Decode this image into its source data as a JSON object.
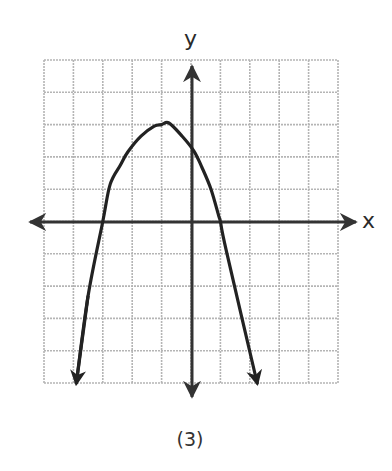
{
  "chart_data": {
    "type": "line",
    "title": "",
    "caption": "(3)",
    "xlabel": "x",
    "ylabel": "y",
    "xlim": [
      -5,
      5
    ],
    "ylim": [
      -5,
      5
    ],
    "grid": true,
    "grid_step": 1,
    "tick_labels": false,
    "series": [
      {
        "name": "parabola",
        "description": "Downward-opening parabola with arrows at both ends",
        "vertex": [
          -1,
          3
        ],
        "x_intercepts": [
          -3,
          1
        ],
        "y_intercept": 2.25,
        "equation_approx": "y = -0.75(x + 1)^2 + 3",
        "points": [
          [
            -3.9,
            -5
          ],
          [
            -3.5,
            -2.3
          ],
          [
            -3,
            0
          ],
          [
            -2.75,
            1.15
          ],
          [
            -2.4,
            1.75
          ],
          [
            -2.15,
            2.15
          ],
          [
            -1.7,
            2.64
          ],
          [
            -1.25,
            2.95
          ],
          [
            -1,
            3
          ],
          [
            -0.75,
            3.05
          ],
          [
            -0.3,
            2.64
          ],
          [
            0.1,
            2.18
          ],
          [
            0.37,
            1.68
          ],
          [
            0.68,
            1.0
          ],
          [
            0.95,
            0.15
          ],
          [
            1,
            0
          ],
          [
            1.2,
            -0.9
          ],
          [
            2.25,
            -5
          ]
        ],
        "end_arrows": true
      }
    ]
  },
  "labels": {
    "x_axis": "x",
    "y_axis": "y",
    "caption": "(3)"
  },
  "colors": {
    "grid": "#b5b5b5",
    "axis": "#333333",
    "curve": "#222222",
    "background": "#ffffff"
  }
}
